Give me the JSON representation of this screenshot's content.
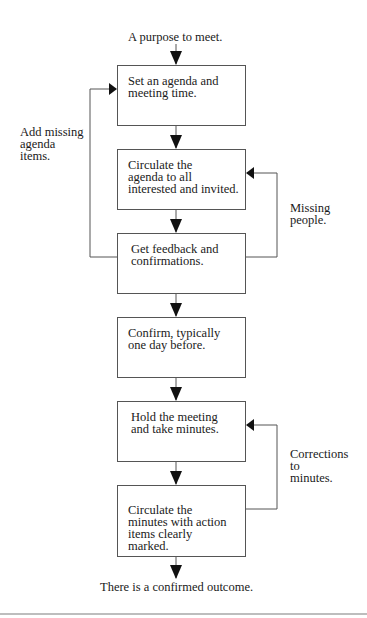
{
  "diagram": {
    "start_label": "A purpose to meet.",
    "end_label": "There is a confirmed outcome.",
    "steps": [
      {
        "text": "Set an agenda and\nmeeting time."
      },
      {
        "text": "Circulate the\nagenda to all\ninterested and invited."
      },
      {
        "text": "Get feedback and\nconfirmations."
      },
      {
        "text": "Confirm, typically\none day before."
      },
      {
        "text": "Hold the meeting\nand take minutes."
      },
      {
        "text": "Circulate the\nminutes with action\nitems clearly\nmarked."
      }
    ],
    "loops": [
      {
        "label": "Add missing\nagenda\nitems.",
        "from_step": 3,
        "to_step": 1,
        "side": "left"
      },
      {
        "label": "Missing\npeople.",
        "from_step": 3,
        "to_step": 2,
        "side": "right"
      },
      {
        "label": "Corrections\n to\nminutes.",
        "from_step": 6,
        "to_step": 5,
        "side": "right"
      }
    ],
    "colors": {
      "line": "#555555",
      "arrow": "#111111",
      "rule": "#bdbdbd"
    }
  }
}
